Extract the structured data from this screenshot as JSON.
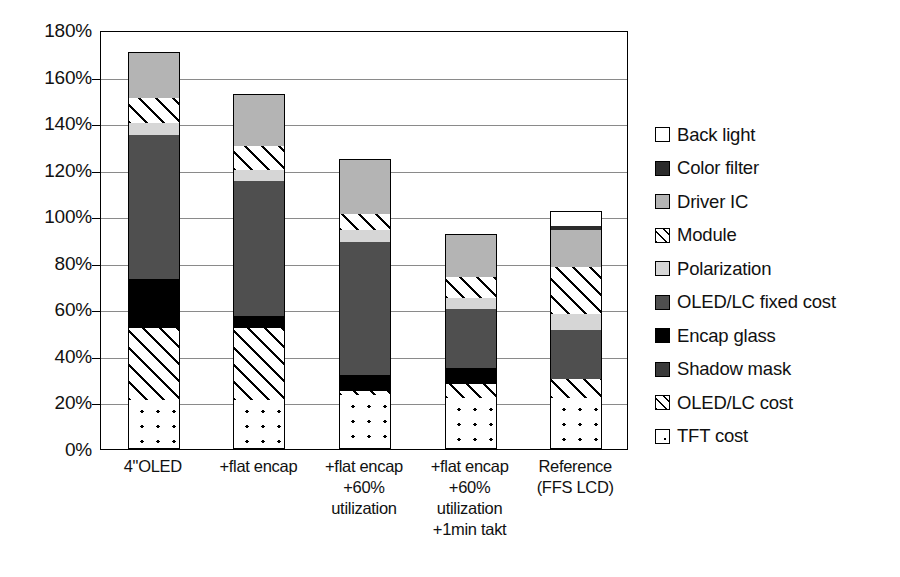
{
  "chart_data": {
    "type": "bar",
    "subtype": "stacked-bar",
    "title": "",
    "xlabel": "",
    "ylabel": "",
    "ylim": [
      0,
      180
    ],
    "y_tick_labels": [
      "180%",
      "160%",
      "140%",
      "120%",
      "100%",
      "80%",
      "60%",
      "40%",
      "20%",
      "0%"
    ],
    "y_tick_values": [
      180,
      160,
      140,
      120,
      100,
      80,
      60,
      40,
      20,
      0
    ],
    "y_unit": "%",
    "grid": true,
    "legend_position": "right",
    "categories": [
      "4\"OLED",
      "+flat encap",
      "+flat encap\n+60%\nutilization",
      "+flat encap\n+60%\nutilization\n+1min takt",
      "Reference\n(FFS LCD)"
    ],
    "category_lines": [
      [
        "4\"OLED"
      ],
      [
        "+flat encap"
      ],
      [
        "+flat encap",
        "+60%",
        "utilization"
      ],
      [
        "+flat encap",
        "+60%",
        "utilization",
        "+1min takt"
      ],
      [
        "Reference",
        "(FFS LCD)"
      ]
    ],
    "series": [
      {
        "name": "TFT cost",
        "pattern": "dots",
        "values": [
          21,
          21,
          23,
          22,
          22
        ]
      },
      {
        "name": "OLED/LC cost",
        "pattern": "hatch",
        "values": [
          31,
          31,
          2,
          6,
          8
        ]
      },
      {
        "name": "Shadow mask",
        "pattern": "darkgray",
        "values": [
          0,
          0,
          0,
          0,
          0
        ]
      },
      {
        "name": "Encap glass",
        "pattern": "black",
        "values": [
          21,
          5,
          7,
          7,
          0
        ]
      },
      {
        "name": "OLED/LC fixed cost",
        "pattern": "midgray",
        "values": [
          62,
          58,
          57,
          25,
          21
        ]
      },
      {
        "name": "Polarization",
        "pattern": "litegray",
        "values": [
          5,
          5,
          5,
          5,
          7
        ]
      },
      {
        "name": "Module",
        "pattern": "hatch",
        "values": [
          11,
          10,
          7,
          9,
          20
        ]
      },
      {
        "name": "Driver IC",
        "pattern": "medgray",
        "values": [
          19,
          22,
          23,
          18,
          16
        ]
      },
      {
        "name": "Color filter",
        "pattern": "dark",
        "values": [
          0,
          0,
          0,
          0,
          2
        ]
      },
      {
        "name": "Back light",
        "pattern": "white",
        "values": [
          0,
          0,
          0,
          0,
          6
        ]
      }
    ],
    "totals": [
      170,
      152,
      124,
      92,
      102
    ],
    "legend_entries": [
      {
        "label": "Back light",
        "pattern": "white"
      },
      {
        "label": "Color filter",
        "pattern": "dark"
      },
      {
        "label": "Driver IC",
        "pattern": "medgray"
      },
      {
        "label": "Module",
        "pattern": "hatch"
      },
      {
        "label": "Polarization",
        "pattern": "litegray"
      },
      {
        "label": "OLED/LC fixed cost",
        "pattern": "midgray"
      },
      {
        "label": "Encap glass",
        "pattern": "black"
      },
      {
        "label": "Shadow mask",
        "pattern": "darkgray"
      },
      {
        "label": "OLED/LC cost",
        "pattern": "hatch"
      },
      {
        "label": "TFT cost",
        "pattern": "dots"
      }
    ],
    "colors": {
      "white": "#ffffff",
      "dark": "#2b2b2b",
      "medgray": "#b4b4b4",
      "litegray": "#d6d6d6",
      "midgray": "#4f4f4f",
      "black": "#000000",
      "darkgray": "#3a3a3a",
      "hatch": "#ffffff",
      "dots": "#ffffff",
      "axis": "#000000",
      "grid": "#8a8a8a"
    }
  }
}
